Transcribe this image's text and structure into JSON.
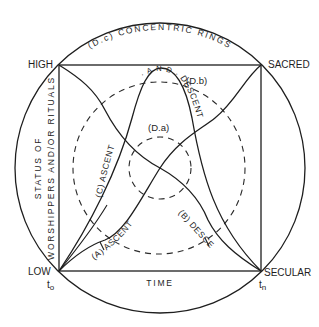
{
  "diagram": {
    "corners": {
      "top_left": "HIGH",
      "top_right": "SACRED",
      "bottom_left": "LOW",
      "bottom_right": "SECULAR"
    },
    "time_marks": {
      "start": "t",
      "start_sub": "o",
      "end": "t",
      "end_sub": "n"
    },
    "axes": {
      "x_label": "TIME",
      "y_label_line1": "STATUS OF",
      "y_label_line2": "WORSHIPPERS AND/OR RITUALS"
    },
    "curves": {
      "a_label": "(A) ASCENT",
      "b_label": "(B) DESCENT",
      "c_label_part1": "(C) ASCENT",
      "c_label_part2": "· A N D ·",
      "c_label_part3": "DESCENT"
    },
    "rings": {
      "inner_label": "(D.a)",
      "middle_label": "(D.b)",
      "outer_label": "(D.c) CONCENTRIC RINGS"
    },
    "colors": {
      "line": "#1e1e1e",
      "background": "#ffffff"
    }
  }
}
